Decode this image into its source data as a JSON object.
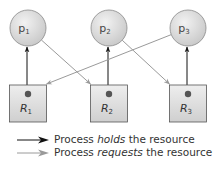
{
  "diagram": {
    "type": "resource-allocation-graph",
    "processes": [
      {
        "id": "p1",
        "letter": "p",
        "sub": "1"
      },
      {
        "id": "p2",
        "letter": "p",
        "sub": "2"
      },
      {
        "id": "p3",
        "letter": "p",
        "sub": "3"
      }
    ],
    "resources": [
      {
        "id": "R1",
        "letter": "R",
        "sub": "1",
        "instances": 1
      },
      {
        "id": "R2",
        "letter": "R",
        "sub": "2",
        "instances": 1
      },
      {
        "id": "R3",
        "letter": "R",
        "sub": "3",
        "instances": 1
      }
    ],
    "edges": [
      {
        "from": "R1",
        "to": "p1",
        "kind": "holds"
      },
      {
        "from": "R2",
        "to": "p2",
        "kind": "holds"
      },
      {
        "from": "R3",
        "to": "p3",
        "kind": "holds"
      },
      {
        "from": "p1",
        "to": "R2",
        "kind": "requests"
      },
      {
        "from": "p2",
        "to": "R3",
        "kind": "requests"
      },
      {
        "from": "p3",
        "to": "R1",
        "kind": "requests"
      }
    ],
    "colors": {
      "holds": "#111111",
      "requests": "#9a9a9a",
      "process_fill": "#d9d9d9",
      "resource_fill": "#d6d6d6",
      "dot": "#555555"
    }
  },
  "legend": {
    "holds": {
      "prefix": "Process ",
      "emph": "holds",
      "suffix": " the resource"
    },
    "requests": {
      "prefix": "Process ",
      "emph": "requests",
      "suffix": " the resource"
    }
  }
}
